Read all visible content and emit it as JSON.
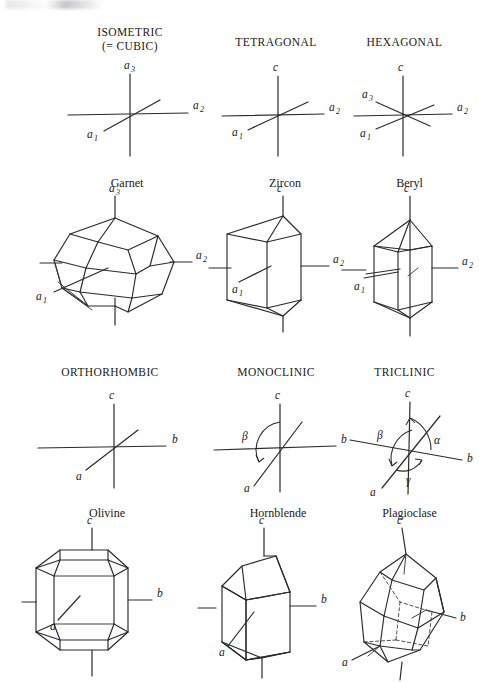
{
  "figure": {
    "background_color": "#ffffff",
    "ink_color": "#2a2a2a",
    "systems": [
      {
        "id": "isometric",
        "title_line1": "ISOMETRIC",
        "title_line2": "(= CUBIC)",
        "axes": [
          "a3",
          "a2",
          "a1"
        ],
        "axis_labels": [
          {
            "base": "a",
            "sub": "3"
          },
          {
            "base": "a",
            "sub": "2"
          },
          {
            "base": "a",
            "sub": "1"
          }
        ],
        "mineral": "Garnet",
        "mineral_axis_labels": [
          {
            "base": "a",
            "sub": "3"
          },
          {
            "base": "a",
            "sub": "2"
          },
          {
            "base": "a",
            "sub": "1"
          }
        ],
        "angles": []
      },
      {
        "id": "tetragonal",
        "title_line1": "TETRAGONAL",
        "title_line2": "",
        "axes": [
          "c",
          "a2",
          "a1"
        ],
        "axis_labels": [
          {
            "base": "c",
            "sub": ""
          },
          {
            "base": "a",
            "sub": "2"
          },
          {
            "base": "a",
            "sub": "1"
          }
        ],
        "mineral": "Zircon",
        "mineral_axis_labels": [
          {
            "base": "c",
            "sub": ""
          },
          {
            "base": "a",
            "sub": "2"
          },
          {
            "base": "a",
            "sub": "1"
          }
        ],
        "angles": []
      },
      {
        "id": "hexagonal",
        "title_line1": "HEXAGONAL",
        "title_line2": "",
        "axes": [
          "c",
          "a2",
          "a1",
          "a3"
        ],
        "axis_labels": [
          {
            "base": "c",
            "sub": ""
          },
          {
            "base": "a",
            "sub": "2"
          },
          {
            "base": "a",
            "sub": "1"
          },
          {
            "base": "a",
            "sub": "3"
          }
        ],
        "mineral": "Beryl",
        "mineral_axis_labels": [
          {
            "base": "c",
            "sub": ""
          },
          {
            "base": "a",
            "sub": "2"
          },
          {
            "base": "a",
            "sub": "1"
          }
        ],
        "angles": []
      },
      {
        "id": "orthorhombic",
        "title_line1": "ORTHORHOMBIC",
        "title_line2": "",
        "axes": [
          "c",
          "b",
          "a"
        ],
        "axis_labels": [
          {
            "base": "c",
            "sub": ""
          },
          {
            "base": "b",
            "sub": ""
          },
          {
            "base": "a",
            "sub": ""
          }
        ],
        "mineral": "Olivine",
        "mineral_axis_labels": [
          {
            "base": "c",
            "sub": ""
          },
          {
            "base": "b",
            "sub": ""
          },
          {
            "base": "a",
            "sub": ""
          }
        ],
        "angles": []
      },
      {
        "id": "monoclinic",
        "title_line1": "MONOCLINIC",
        "title_line2": "",
        "axes": [
          "c",
          "b",
          "a"
        ],
        "axis_labels": [
          {
            "base": "c",
            "sub": ""
          },
          {
            "base": "b",
            "sub": ""
          },
          {
            "base": "a",
            "sub": ""
          }
        ],
        "mineral": "Hornblende",
        "mineral_axis_labels": [
          {
            "base": "c",
            "sub": ""
          },
          {
            "base": "b",
            "sub": ""
          },
          {
            "base": "a",
            "sub": ""
          }
        ],
        "angles": [
          "β"
        ]
      },
      {
        "id": "triclinic",
        "title_line1": "TRICLINIC",
        "title_line2": "",
        "axes": [
          "c",
          "b",
          "a"
        ],
        "axis_labels": [
          {
            "base": "c",
            "sub": ""
          },
          {
            "base": "b",
            "sub": ""
          },
          {
            "base": "a",
            "sub": ""
          }
        ],
        "mineral": "Plagioclase",
        "mineral_axis_labels": [
          {
            "base": "c",
            "sub": ""
          },
          {
            "base": "b",
            "sub": ""
          },
          {
            "base": "a",
            "sub": ""
          }
        ],
        "angles": [
          "α",
          "β",
          "γ"
        ]
      }
    ],
    "greek": {
      "alpha": "α",
      "beta": "β",
      "gamma": "γ"
    }
  }
}
